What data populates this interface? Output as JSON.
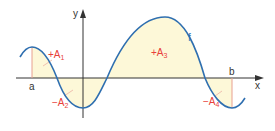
{
  "figure": {
    "type": "function-graph-area-diagram",
    "axes": {
      "x_label": "x",
      "y_label": "y"
    },
    "bounds": {
      "left_label": "a",
      "right_label": "b"
    },
    "function_label": "f",
    "areas": [
      {
        "sign": "+",
        "name": "A",
        "index": "1"
      },
      {
        "sign": "−",
        "name": "A",
        "index": "2"
      },
      {
        "sign": "+",
        "name": "A",
        "index": "3"
      },
      {
        "sign": "−",
        "name": "A",
        "index": "4"
      }
    ],
    "colors": {
      "curve": "#2f6fb0",
      "fill": "#fdf8d8",
      "area_labels": "#e8403a",
      "bound_lines": "#e8a090",
      "axes": "#333333"
    }
  }
}
